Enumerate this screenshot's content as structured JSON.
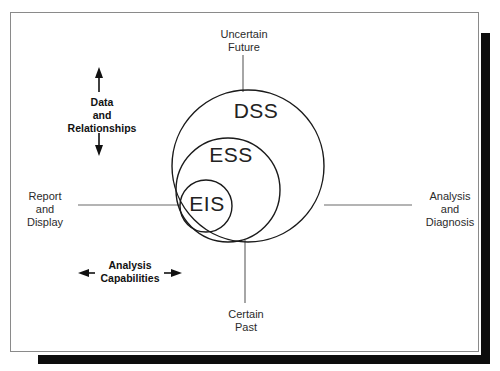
{
  "figure": {
    "type": "venn-nested-circles"
  },
  "circles": [
    {
      "id": "dss",
      "label": "DSS",
      "cx": 248,
      "cy": 166,
      "r": 76
    },
    {
      "id": "ess",
      "label": "ESS",
      "cx": 228,
      "cy": 190,
      "r": 52
    },
    {
      "id": "eis",
      "label": "EIS",
      "cx": 206,
      "cy": 206,
      "r": 26
    }
  ],
  "callouts": {
    "top": {
      "line1": "Uncertain",
      "line2": "Future"
    },
    "bottom": {
      "line1": "Certain",
      "line2": "Past"
    },
    "left": {
      "line1": "Report",
      "line2": "and",
      "line3": "Display"
    },
    "right": {
      "line1": "Analysis",
      "line2": "and",
      "line3": "Diagnosis"
    }
  },
  "axes": {
    "vertical": {
      "line1": "Data",
      "line2": "and",
      "line3": "Relationships",
      "direction": "double-vertical"
    },
    "horizontal": {
      "line1": "Analysis",
      "line2": "Capabilities",
      "direction": "double-horizontal"
    }
  },
  "colors": {
    "stroke": "#1a1a1a",
    "connector": "#6b6b6b",
    "frame": "#8a8a8a",
    "shadow": "#0d0d0d",
    "text": "#2b2b2b",
    "background": "#ffffff"
  }
}
